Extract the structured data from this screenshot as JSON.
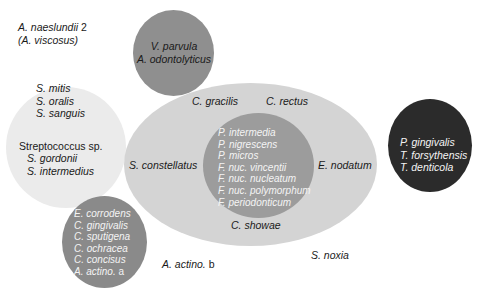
{
  "colors": {
    "background": "#ffffff",
    "yellow_complex": "#ebebeb",
    "purple_complex": "#8f8f8f",
    "green_complex": "#8a8a8a",
    "orange_outer": "#d4d4d4",
    "orange_inner": "#9c9c9c",
    "red_complex": "#2b2b2b"
  },
  "groups": {
    "actinomyces": {
      "lines": [
        "A. naeslundii 2",
        "(A. viscosus)"
      ]
    },
    "purple": {
      "lines": [
        "V. parvula",
        "A. odontolyticus"
      ]
    },
    "yellow": {
      "top_lines": [
        "S. mitis",
        "S. oralis",
        "S. sanguis"
      ],
      "genus_label": "Streptococcus sp.",
      "bottom_lines": [
        "S. gordonii",
        "S. intermedius"
      ]
    },
    "green": {
      "lines": [
        "E. corrodens",
        "C. gingivalis",
        "C. sputigena",
        "C. ochracea",
        "C. concisus",
        "A. actino. a"
      ]
    },
    "orange_outer": {
      "top_left": "C. gracilis",
      "top_right": "C. rectus",
      "left": "S. constellatus",
      "right": "E. nodatum",
      "bottom": "C. showae"
    },
    "orange_inner": {
      "lines": [
        "P. intermedia",
        "P. nigrescens",
        "P. micros",
        "F. nuc. vincentii",
        "F. nuc. nucleatum",
        "F. nuc. polymorphum",
        "F. periodonticum"
      ]
    },
    "red": {
      "lines": [
        "P. gingivalis",
        "T. forsythensis",
        "T. denticola"
      ]
    },
    "unassigned": {
      "actino_b": "A. actino. b",
      "noxia": "S. noxia"
    }
  }
}
